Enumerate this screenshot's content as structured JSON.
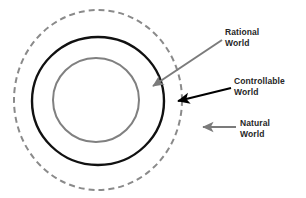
{
  "diagram": {
    "background_color": "#ffffff",
    "canvas": {
      "width": 306,
      "height": 198
    },
    "rings": [
      {
        "id": "natural-world",
        "name": "Natural World",
        "stroke_color": "#8a8a8a",
        "stroke_width": 2,
        "stroke_style": "dashed",
        "dash_pattern": "6 4",
        "fill": "none",
        "center_x": 98,
        "center_y": 100,
        "radius_x": 84,
        "radius_y": 90
      },
      {
        "id": "controllable-world",
        "name": "Controllable World",
        "stroke_color": "#111111",
        "stroke_width": 2.4,
        "stroke_style": "solid",
        "fill": "none",
        "center_x": 98,
        "center_y": 101,
        "radius_x": 66,
        "radius_y": 64
      },
      {
        "id": "rational-world",
        "name": "Rational World",
        "stroke_color": "#808080",
        "stroke_width": 2,
        "stroke_style": "solid",
        "fill": "none",
        "center_x": 96,
        "center_y": 100,
        "radius_x": 43,
        "radius_y": 42
      }
    ],
    "labels": {
      "rational_world": {
        "line1": "Rational",
        "line2": "World",
        "color": "#262626"
      },
      "controllable_world": {
        "line1": "Controllable",
        "line2": "World",
        "color": "#262626"
      },
      "natural_world": {
        "line1": "Natural",
        "line2": "World",
        "color": "#262626"
      }
    },
    "arrows": [
      {
        "id": "arrow-rational-world",
        "name": "rational-world-arrow",
        "color": "#7b7b7b",
        "stroke_width": 2,
        "from_x": 222,
        "from_y": 40,
        "to_x": 153,
        "to_y": 86
      },
      {
        "id": "arrow-controllable-world",
        "name": "controllable-world-arrow",
        "color": "#000000",
        "stroke_width": 2.2,
        "from_x": 231,
        "from_y": 88,
        "to_x": 178,
        "to_y": 101
      },
      {
        "id": "arrow-natural-world",
        "name": "natural-world-arrow",
        "color": "#7b7b7b",
        "stroke_width": 2,
        "from_x": 236,
        "from_y": 127,
        "to_x": 203,
        "to_y": 127
      }
    ]
  }
}
